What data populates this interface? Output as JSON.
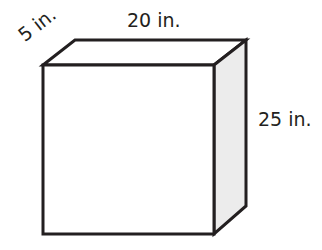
{
  "figure": {
    "type": "rectangular prism",
    "dimensions": {
      "depth": "5 in.",
      "width": "20 in.",
      "height": "25 in."
    },
    "colors": {
      "stroke": "#231f20",
      "front_face": "#ffffff",
      "side_face": "#ececec",
      "top_face": "#ffffff"
    }
  }
}
